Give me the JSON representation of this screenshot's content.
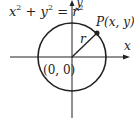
{
  "equation": {
    "x": "x",
    "plus": " + ",
    "y": "y",
    "eq": " = ",
    "r": "r",
    "exp": "2"
  },
  "axes": {
    "x_label": "x",
    "y_label": "y"
  },
  "origin_label": "(0, 0)",
  "point_label": {
    "name": "P",
    "coords": "(x, y)"
  },
  "radius_label": "r",
  "colors": {
    "stroke": "#222222",
    "background": "#ffffff"
  }
}
